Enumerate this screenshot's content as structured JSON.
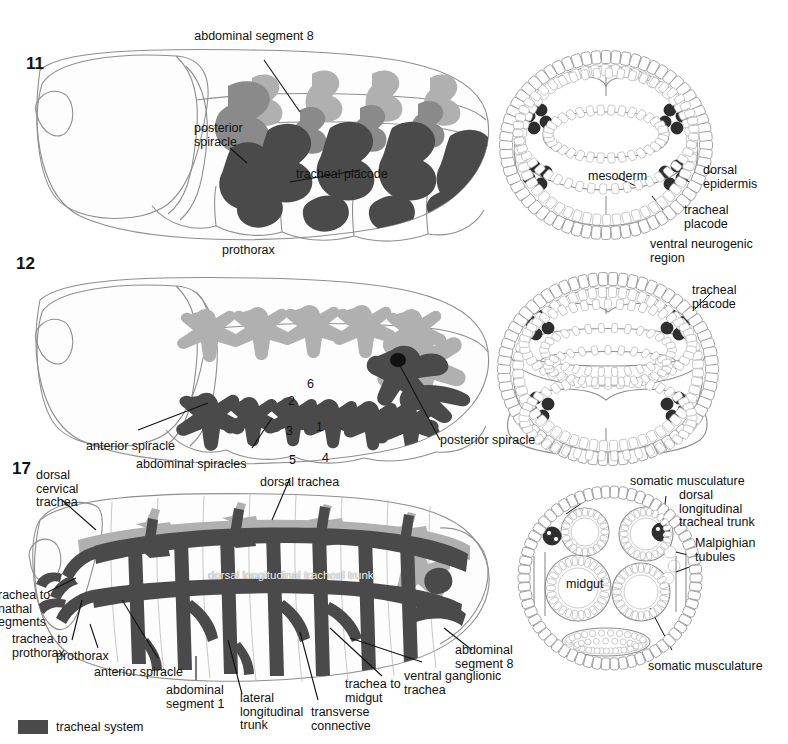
{
  "figure": {
    "legend": {
      "swatch_color": "#4a4a4a",
      "label": "tracheal system"
    }
  },
  "panels": [
    {
      "number": "11",
      "lateral_labels": [
        "abdominal segment 8",
        "posterior\nspiracle",
        "tracheal placode",
        "prothorax"
      ],
      "cross_section_labels": [
        "mesoderm",
        "dorsal\nepidermis",
        "tracheal\nplacode",
        "ventral neurogenic\nregion"
      ]
    },
    {
      "number": "12",
      "lateral_labels": [
        "anterior spiracle",
        "abdominal spiracles",
        "posterior spiracle"
      ],
      "branch_numbers": [
        "1",
        "2",
        "3",
        "4",
        "5",
        "6"
      ],
      "cross_section_labels": [
        "tracheal\nplacode"
      ]
    },
    {
      "number": "17",
      "lateral_labels": [
        "dorsal\ncervical\ntrachea",
        "dorsal trachea",
        "trachea to\ngnathal\nsegments",
        "trachea to\nprothorax",
        "prothorax",
        "anterior spiracle",
        "abdominal\nsegment 1",
        "lateral\nlongitudinal\ntrunk",
        "transverse\nconnective",
        "trachea to\nmidgut",
        "ventral ganglionic\ntrachea",
        "abdominal\nsegment 8"
      ],
      "overlay_label": "dorsal longitudinal tracheal trunk",
      "cross_section_labels": [
        "somatic musculature",
        "dorsal\nlongitudinal\ntracheal trunk",
        "Malpighian\ntubules",
        "midgut",
        "somatic musculature"
      ]
    }
  ],
  "text": {
    "p11_num": "11",
    "p11_abd8": "abdominal segment 8",
    "p11_postspir": "posterior\nspiracle",
    "p11_placode": "tracheal placode",
    "p11_prothorax": "prothorax",
    "p11_mesoderm": "mesoderm",
    "p11_dorsepi": "dorsal\nepidermis",
    "p11_trplac": "tracheal\nplacode",
    "p11_vnr": "ventral neurogenic\nregion",
    "p12_num": "12",
    "p12_antspir": "anterior spiracle",
    "p12_abdspir": "abdominal spiracles",
    "p12_postspir": "posterior spiracle",
    "p12_trplac": "tracheal\nplacode",
    "p12_n1": "1",
    "p12_n2": "2",
    "p12_n3": "3",
    "p12_n4": "4",
    "p12_n5": "5",
    "p12_n6": "6",
    "p17_num": "17",
    "p17_dct": "dorsal\ncervical\ntrachea",
    "p17_dorstr": "dorsal trachea",
    "p17_gnathal": "rachea to\nnathal\negments",
    "p17_toproth": "trachea to\nprothorax",
    "p17_prothorax": "prothorax",
    "p17_antspir": "anterior spiracle",
    "p17_abd1": "abdominal\nsegment 1",
    "p17_llt": "lateral\nlongitudinal\ntrunk",
    "p17_tc": "transverse\nconnective",
    "p17_midgut_tr": "trachea to\nmidgut",
    "p17_vgt": "ventral ganglionic\ntrachea",
    "p17_abd8": "abdominal\nsegment 8",
    "p17_dltt": "dorsal longitudinal tracheal trunk",
    "p17_som1": "somatic musculature",
    "p17_dltt2": "dorsal\nlongitudinal\ntracheal trunk",
    "p17_malp": "Malpighian\ntubules",
    "p17_midgut": "midgut",
    "p17_som2": "somatic musculature",
    "legend_label": "tracheal system"
  }
}
